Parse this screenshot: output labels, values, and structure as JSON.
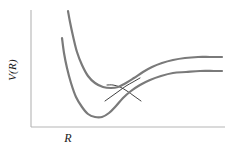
{
  "figure": {
    "background_color": "#ffffff",
    "axis_color": "#b5b5b5",
    "adiabatic_color": "#7a7a7a",
    "diabatic_color": "#2b2b2b",
    "label_color": "#1a1a1a"
  },
  "axes": {
    "x_label": "R",
    "y_label": "V(R)",
    "x_axis_y": 127,
    "x_axis_x_start": 31,
    "x_axis_x_end": 225,
    "y_axis_x": 31,
    "y_axis_y_start": 10,
    "y_axis_y_end": 127,
    "ticks_shown": false,
    "grid_shown": false
  },
  "chart_data": {
    "type": "line",
    "title": "",
    "xlabel": "R",
    "ylabel": "V(R)",
    "xlim": [
      31,
      225
    ],
    "ylim": [
      127,
      10
    ],
    "grid": false,
    "legend": "none",
    "series": [
      {
        "name": "upper-adiabatic",
        "style": "thick-gray",
        "color": "#7a7a7a",
        "width": 2.2,
        "points": [
          [
            68,
            11
          ],
          [
            70,
            22
          ],
          [
            73,
            36
          ],
          [
            77,
            52
          ],
          [
            82,
            65
          ],
          [
            88,
            76
          ],
          [
            95,
            83
          ],
          [
            103,
            87
          ],
          [
            111,
            88
          ],
          [
            118,
            87
          ],
          [
            126,
            83
          ],
          [
            134,
            78
          ],
          [
            143,
            72
          ],
          [
            152,
            67
          ],
          [
            162,
            63
          ],
          [
            173,
            60
          ],
          [
            185,
            58
          ],
          [
            198,
            57
          ],
          [
            210,
            57
          ],
          [
            222,
            57
          ]
        ]
      },
      {
        "name": "lower-adiabatic",
        "style": "thick-gray",
        "color": "#7a7a7a",
        "width": 2.2,
        "points": [
          [
            62,
            38
          ],
          [
            64,
            53
          ],
          [
            67,
            68
          ],
          [
            71,
            83
          ],
          [
            76,
            97
          ],
          [
            82,
            107
          ],
          [
            88,
            114
          ],
          [
            95,
            117
          ],
          [
            102,
            117
          ],
          [
            109,
            113
          ],
          [
            116,
            106
          ],
          [
            123,
            98
          ],
          [
            131,
            91
          ],
          [
            140,
            85
          ],
          [
            150,
            80
          ],
          [
            161,
            76
          ],
          [
            173,
            73
          ],
          [
            186,
            72
          ],
          [
            200,
            71
          ],
          [
            214,
            71
          ],
          [
            222,
            71
          ]
        ]
      },
      {
        "name": "diabatic-rising",
        "style": "thin-dark",
        "color": "#2b2b2b",
        "width": 0.9,
        "points": [
          [
            107,
            85
          ],
          [
            113,
            85
          ],
          [
            120,
            87
          ],
          [
            127,
            91
          ],
          [
            134,
            96
          ],
          [
            141,
            101
          ]
        ]
      },
      {
        "name": "diabatic-falling",
        "style": "thin-dark",
        "color": "#2b2b2b",
        "width": 0.9,
        "points": [
          [
            105,
            101
          ],
          [
            112,
            96
          ],
          [
            119,
            91
          ],
          [
            126,
            86
          ],
          [
            133,
            82
          ],
          [
            140,
            78
          ]
        ]
      }
    ],
    "annotations": [
      {
        "name": "avoided-crossing-point",
        "x": 124,
        "y": 88
      },
      {
        "name": "deep-well-minimum",
        "x": 98,
        "y": 117
      },
      {
        "name": "shallow-well-minimum",
        "x": 112,
        "y": 88
      }
    ]
  }
}
